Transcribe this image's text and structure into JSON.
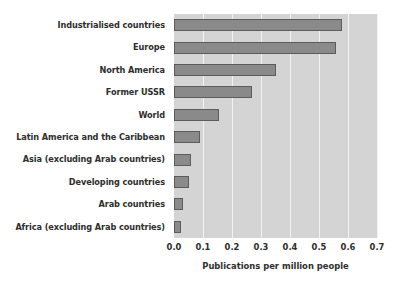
{
  "chart_data": {
    "type": "bar",
    "orientation": "horizontal",
    "title": "",
    "xlabel": "Publications per million people",
    "ylabel": "",
    "xlim": [
      0.0,
      0.7
    ],
    "xticks": [
      "0.0",
      "0.1",
      "0.2",
      "0.3",
      "0.4",
      "0.5",
      "0.6",
      "0.7"
    ],
    "xtick_values": [
      0.0,
      0.1,
      0.2,
      0.3,
      0.4,
      0.5,
      0.6,
      0.7
    ],
    "grid": true,
    "grid_axis": "x",
    "legend": false,
    "categories": [
      "Industrialised countries",
      "Europe",
      "North America",
      "Former USSR",
      "World",
      "Latin America and the Caribbean",
      "Asia (excluding Arab countries)",
      "Developing countries",
      "Arab countries",
      "Africa (excluding Arab countries)"
    ],
    "values": [
      0.58,
      0.56,
      0.35,
      0.27,
      0.155,
      0.09,
      0.06,
      0.05,
      0.03,
      0.025
    ],
    "colors": {
      "bar_fill": "#8a8a8a",
      "bar_edge": "#5c5c5c",
      "plot_background": "#d4d4d4",
      "gridline": "#f2f2f2",
      "text": "#2e2e2e",
      "figure_background": "#ffffff"
    }
  }
}
